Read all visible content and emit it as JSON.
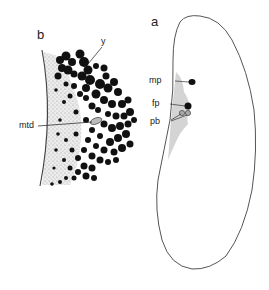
{
  "figure": {
    "panels": [
      {
        "id": "a",
        "label": "a",
        "description": "Cell outline with organelles",
        "annotations": [
          {
            "key": "mp",
            "label": "mp"
          },
          {
            "key": "fp",
            "label": "fp"
          },
          {
            "key": "pb",
            "label": "pb"
          }
        ]
      },
      {
        "id": "b",
        "label": "b",
        "description": "Enlarged cortical region with granules",
        "annotations": [
          {
            "key": "y",
            "label": "y"
          },
          {
            "key": "mtd",
            "label": "mtd"
          }
        ]
      }
    ]
  },
  "colors": {
    "outline": "#555555",
    "granule": "#111111",
    "stipple": "#cfcfcf",
    "background": "#ffffff"
  }
}
